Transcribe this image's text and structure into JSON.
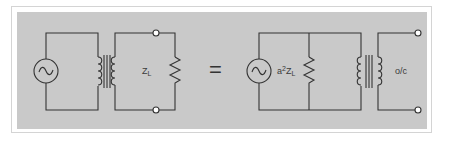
{
  "figure": {
    "left_circuit": {
      "load_label_main": "Z",
      "load_label_sub": "L"
    },
    "equals_symbol": "=",
    "right_circuit": {
      "reflected_label_prefix": "a",
      "reflected_label_exp": "2",
      "reflected_label_main": "Z",
      "reflected_label_sub": "L",
      "open_circuit_label": "o/c"
    },
    "icons": [
      "ac-source-icon",
      "transformer-icon",
      "resistor-icon",
      "terminal-icon"
    ],
    "colors": {
      "panel": "#c9c9c9",
      "frame_border": "#d4d4d4",
      "line": "#333333",
      "background": "#ffffff"
    }
  }
}
